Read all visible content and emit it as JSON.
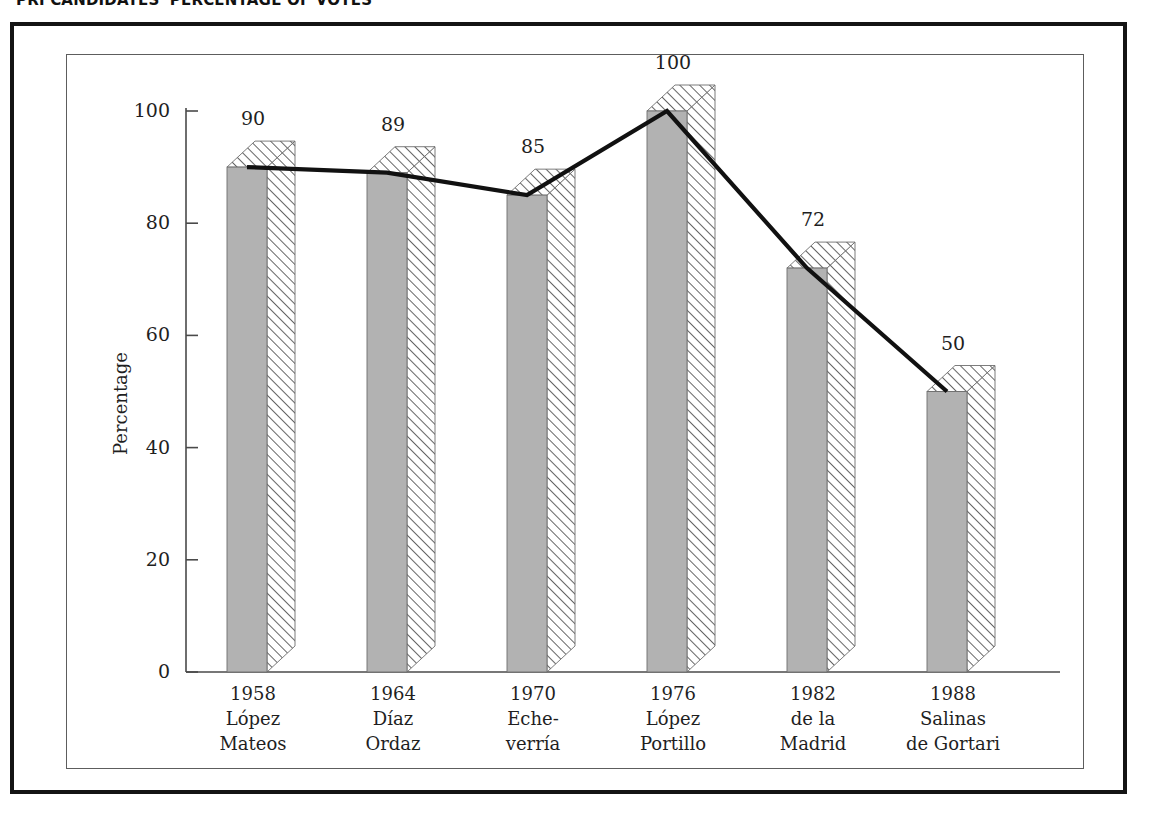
{
  "title": "PRI CANDIDATES' PERCENTAGE OF VOTES",
  "axes": {
    "y_title": "Percentage",
    "y_ticks": [
      "0",
      "20",
      "40",
      "60",
      "80",
      "100"
    ]
  },
  "colors": {
    "bar_face": "#b2b2b2",
    "bar_outline": "#6e6e6e",
    "hatch_line": "#555555",
    "line_series": "#111111",
    "frame_outer": "#141414",
    "frame_inner": "#5d5d5d",
    "axis": "#4a4a4a",
    "text": "#1f1f1f"
  },
  "chart_data": {
    "type": "bar",
    "title": "PRI CANDIDATES' PERCENTAGE OF VOTES",
    "xlabel": "",
    "ylabel": "Percentage",
    "ylim": [
      0,
      100
    ],
    "yticks": [
      0,
      20,
      40,
      60,
      80,
      100
    ],
    "grid": false,
    "legend": "none",
    "categories": [
      "1958 López Mateos",
      "1964 Díaz Ordaz",
      "1970 Eche-verría",
      "1976 López Portillo",
      "1982 de la Madrid",
      "1988 Salinas de Gortari"
    ],
    "values": [
      90,
      89,
      85,
      100,
      72,
      50
    ],
    "series": [
      {
        "name": "Percentage of votes (bars)",
        "values": [
          90,
          89,
          85,
          100,
          72,
          50
        ]
      },
      {
        "name": "Trend line",
        "values": [
          90,
          89,
          85,
          100,
          72,
          50
        ]
      }
    ],
    "points": [
      {
        "year": "1958",
        "candidate_line1": "López",
        "candidate_line2": "Mateos",
        "value": 90,
        "value_label": "90"
      },
      {
        "year": "1964",
        "candidate_line1": "Díaz",
        "candidate_line2": "Ordaz",
        "value": 89,
        "value_label": "89"
      },
      {
        "year": "1970",
        "candidate_line1": "Eche-",
        "candidate_line2": "verría",
        "value": 85,
        "value_label": "85"
      },
      {
        "year": "1976",
        "candidate_line1": "López",
        "candidate_line2": "Portillo",
        "value": 100,
        "value_label": "100"
      },
      {
        "year": "1982",
        "candidate_line1": "de la",
        "candidate_line2": "Madrid",
        "value": 72,
        "value_label": "72"
      },
      {
        "year": "1988",
        "candidate_line1": "Salinas",
        "candidate_line2": "de Gortari",
        "value": 50,
        "value_label": "50"
      }
    ]
  }
}
